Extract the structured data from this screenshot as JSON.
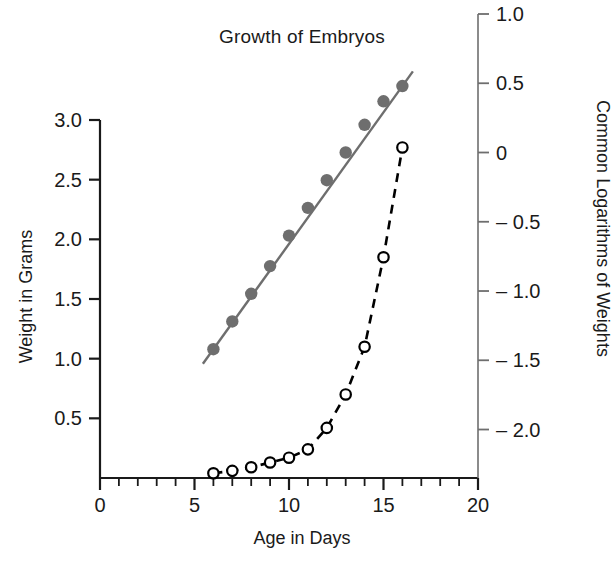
{
  "chart_data": {
    "type": "line",
    "title": "Growth of Embryos",
    "xlabel": "Age in Days",
    "ylabel": "Weight in Grams",
    "ylabel_right": "Common Logarithms of Weights",
    "grid": false,
    "legend": "none",
    "xlim": [
      0,
      20
    ],
    "ylim": [
      0,
      3.0
    ],
    "ylim_right": [
      -2.35,
      1.0
    ],
    "xticks": [
      0,
      5,
      10,
      15,
      20
    ],
    "xticklabels": [
      "0",
      "5",
      "10",
      "15",
      "20"
    ],
    "xminor_step": 1,
    "yticks_left": [
      0.5,
      1.0,
      1.5,
      2.0,
      2.5,
      3.0
    ],
    "yticklabels_left": [
      "0.5",
      "1.0",
      "1.5",
      "2.0",
      "2.5",
      "3.0"
    ],
    "yticks_right": [
      1.0,
      0.5,
      0,
      -0.5,
      -1.0,
      -1.5,
      -2.0
    ],
    "yticklabels_right": [
      "1.0",
      "0.5",
      "0",
      "– 0.5",
      "– 1.0",
      "– 1.5",
      "– 2.0"
    ],
    "series": [
      {
        "name": "Common logarithm of weight",
        "axis": "right",
        "marker": "filled-circle",
        "linestyle": "solid",
        "color": "#6e6e6e",
        "x": [
          6,
          7,
          8,
          9,
          10,
          11,
          12,
          13,
          14,
          15,
          16
        ],
        "y": [
          -1.42,
          -1.22,
          -1.02,
          -0.82,
          -0.6,
          -0.4,
          -0.2,
          0.0,
          0.2,
          0.37,
          0.48
        ]
      },
      {
        "name": "Weight in grams",
        "axis": "left",
        "marker": "open-circle",
        "linestyle": "dashed",
        "color": "#000000",
        "x": [
          6,
          7,
          8,
          9,
          10,
          11,
          12,
          13,
          14,
          15,
          16
        ],
        "y": [
          0.04,
          0.06,
          0.09,
          0.13,
          0.17,
          0.24,
          0.42,
          0.7,
          1.1,
          1.85,
          2.77
        ]
      }
    ]
  },
  "labels": {
    "title": "Growth of Embryos",
    "xlabel": "Age in Days",
    "ylabel_left": "Weight in Grams",
    "ylabel_right": "Common Logarithms of Weights"
  }
}
